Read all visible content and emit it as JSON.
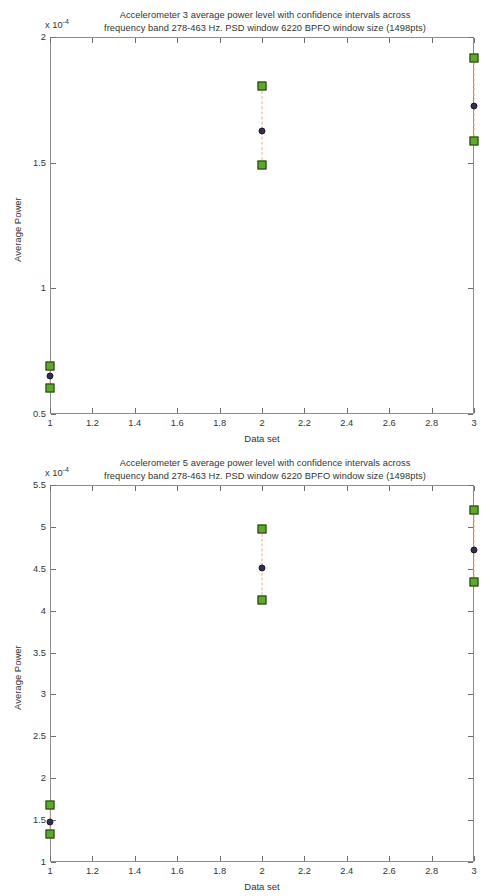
{
  "figures": [
    {
      "id": "accelerometer-3",
      "title": "Accelerometer 3 average power level with confidence intervals across\nfrequency band 278-463 Hz. PSD window 6220 BPFO window size (1498pts)",
      "exponent_label": "x 10",
      "exponent_power": "-4",
      "chart_data": {
        "type": "scatter",
        "title": "Accelerometer 3 average power level with confidence intervals across frequency band 278-463 Hz. PSD window 6220 BPFO window size (1498pts)",
        "xlabel": "Data set",
        "ylabel": "Average Power",
        "y_scale_factor": "x 10^-4",
        "xlim": [
          1,
          3
        ],
        "ylim": [
          0.5,
          2
        ],
        "xticks": [
          1,
          1.2,
          1.4,
          1.6,
          1.8,
          2,
          2.2,
          2.4,
          2.6,
          2.8,
          3
        ],
        "xtick_labels": [
          "1",
          "1.2",
          "1.4",
          "1.6",
          "1.8",
          "2",
          "2.2",
          "2.4",
          "2.6",
          "2.8",
          "3"
        ],
        "yticks": [
          0.5,
          1,
          1.5,
          2
        ],
        "ytick_labels": [
          "0.5",
          "1",
          "1.5",
          "2"
        ],
        "grid": false,
        "legend": null,
        "series": [
          {
            "name": "Confidence interval upper bound",
            "marker": "green-square",
            "x": [
              1,
              2,
              3
            ],
            "values": [
              0.69,
              1.805,
              1.915
            ]
          },
          {
            "name": "Mean average power",
            "marker": "navy-circle",
            "x": [
              1,
              2,
              3
            ],
            "values": [
              0.652,
              1.625,
              1.725
            ]
          },
          {
            "name": "Confidence interval lower bound",
            "marker": "green-square",
            "x": [
              1,
              2,
              3
            ],
            "values": [
              0.605,
              1.49,
              1.585
            ]
          }
        ]
      }
    },
    {
      "id": "accelerometer-5",
      "title": "Accelerometer 5 average power level with confidence intervals across\nfrequency band 278-463 Hz. PSD window 6220 BPFO window size (1498pts)",
      "exponent_label": "x 10",
      "exponent_power": "-4",
      "chart_data": {
        "type": "scatter",
        "title": "Accelerometer 5 average power level with confidence intervals across frequency band 278-463 Hz. PSD window 6220 BPFO window size (1498pts)",
        "xlabel": "Data set",
        "ylabel": "Average Power",
        "y_scale_factor": "x 10^-4",
        "xlim": [
          1,
          3
        ],
        "ylim": [
          1,
          5.5
        ],
        "xticks": [
          1,
          1.2,
          1.4,
          1.6,
          1.8,
          2,
          2.2,
          2.4,
          2.6,
          2.8,
          3
        ],
        "xtick_labels": [
          "1",
          "1.2",
          "1.4",
          "1.6",
          "1.8",
          "2",
          "2.2",
          "2.4",
          "2.6",
          "2.8",
          "3"
        ],
        "yticks": [
          1,
          1.5,
          2,
          2.5,
          3,
          3.5,
          4,
          4.5,
          5,
          5.5
        ],
        "ytick_labels": [
          "1",
          "1.5",
          "2",
          "2.5",
          "3",
          "3.5",
          "4",
          "4.5",
          "5",
          "5.5"
        ],
        "grid": false,
        "legend": null,
        "series": [
          {
            "name": "Confidence interval upper bound",
            "marker": "green-square",
            "x": [
              1,
              2,
              3
            ],
            "values": [
              1.68,
              4.97,
              5.2
            ]
          },
          {
            "name": "Mean average power",
            "marker": "navy-circle",
            "x": [
              1,
              2,
              3
            ],
            "values": [
              1.48,
              4.51,
              4.72
            ]
          },
          {
            "name": "Confidence interval lower bound",
            "marker": "green-square",
            "x": [
              1,
              2,
              3
            ],
            "values": [
              1.33,
              4.13,
              4.34
            ]
          }
        ]
      }
    }
  ],
  "colors": {
    "marker_fill": "#5fa82c",
    "marker_edge": "#1f3d10",
    "mean_dot": "#33304f",
    "ci_line": "#f0a882",
    "axis": "#8d8d8d",
    "text": "#333333",
    "background": "#ffffff"
  }
}
